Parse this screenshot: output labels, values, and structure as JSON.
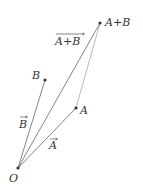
{
  "diagram": {
    "colors": {
      "line": "#555555",
      "faint_line": "#9a9a9a",
      "point": "#333333",
      "text": "#333333"
    },
    "points": {
      "O": {
        "label": "O",
        "x": 18,
        "y": 168
      },
      "A": {
        "label": "A",
        "x": 76,
        "y": 108
      },
      "B": {
        "label": "B",
        "x": 45,
        "y": 80
      },
      "AB": {
        "label": "A+B",
        "x": 100,
        "y": 23
      }
    },
    "vectors": {
      "A": {
        "label": "A"
      },
      "B": {
        "label": "B"
      },
      "AB": {
        "label": "A+B"
      }
    }
  }
}
